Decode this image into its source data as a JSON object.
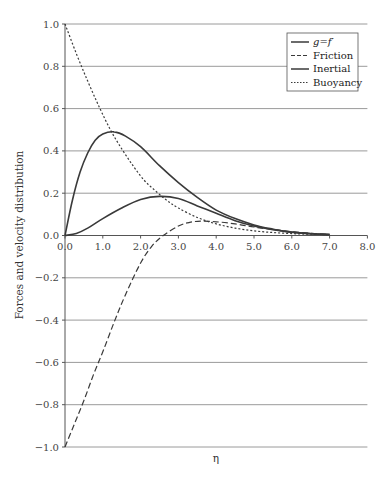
{
  "chart_data": {
    "type": "line",
    "title": "",
    "xlabel": "η",
    "ylabel": "Forces and velocity distribution",
    "xlim": [
      0,
      8
    ],
    "ylim": [
      -1.0,
      1.0
    ],
    "x_ticks": [
      "0.0",
      "1.0",
      "2.0",
      "3.0",
      "4.0",
      "5.0",
      "6.0",
      "7.0",
      "8.0"
    ],
    "y_ticks": [
      "1.0",
      "0.8",
      "0.6",
      "0.4",
      "0.2",
      "0.0",
      "−0.2",
      "−0.4",
      "−0.6",
      "−0.8",
      "−1.0"
    ],
    "grid": "horizontal",
    "legend_position": "top-right",
    "series": [
      {
        "name": "g=f′",
        "style": "solid",
        "x": [
          0,
          0.2,
          0.4,
          0.6,
          0.8,
          1.0,
          1.3,
          1.6,
          2.0,
          2.5,
          3.0,
          3.5,
          4.0,
          4.5,
          5.0,
          5.5,
          6.0,
          6.5,
          7.0
        ],
        "values": [
          0,
          0.17,
          0.3,
          0.39,
          0.45,
          0.48,
          0.49,
          0.47,
          0.42,
          0.33,
          0.25,
          0.18,
          0.12,
          0.08,
          0.05,
          0.03,
          0.015,
          0.008,
          0.004
        ]
      },
      {
        "name": "Friction",
        "style": "dashed",
        "x": [
          0,
          0.25,
          0.5,
          0.75,
          1.0,
          1.3,
          1.6,
          2.0,
          2.3,
          2.6,
          3.0,
          3.3,
          3.6,
          4.0,
          4.5,
          5.0,
          5.5,
          6.0,
          6.5,
          7.0
        ],
        "values": [
          -1.0,
          -0.89,
          -0.78,
          -0.66,
          -0.55,
          -0.41,
          -0.28,
          -0.13,
          -0.05,
          0.0,
          0.045,
          0.062,
          0.068,
          0.065,
          0.055,
          0.04,
          0.028,
          0.018,
          0.01,
          0.005
        ]
      },
      {
        "name": "Inertial",
        "style": "solid",
        "x": [
          0,
          0.3,
          0.6,
          1.0,
          1.5,
          2.0,
          2.5,
          3.0,
          3.5,
          4.0,
          4.5,
          5.0,
          5.5,
          6.0,
          6.5,
          7.0
        ],
        "values": [
          0,
          0.01,
          0.035,
          0.08,
          0.13,
          0.17,
          0.185,
          0.175,
          0.14,
          0.105,
          0.07,
          0.045,
          0.028,
          0.016,
          0.009,
          0.005
        ]
      },
      {
        "name": "Buoyancy",
        "style": "dotted",
        "x": [
          0,
          0.3,
          0.6,
          0.9,
          1.2,
          1.5,
          1.8,
          2.1,
          2.4,
          2.7,
          3.0,
          3.5,
          4.0,
          4.5,
          5.0,
          5.5,
          6.0,
          6.5,
          7.0
        ],
        "values": [
          1.0,
          0.86,
          0.73,
          0.61,
          0.5,
          0.41,
          0.33,
          0.26,
          0.21,
          0.165,
          0.13,
          0.085,
          0.055,
          0.035,
          0.022,
          0.014,
          0.009,
          0.006,
          0.004
        ]
      }
    ],
    "legend": [
      "g=f′",
      "Friction",
      "Inertial",
      "Buoyancy"
    ]
  },
  "colors": {
    "line": "#3a3a3a",
    "grid": "#9a9a9a",
    "axis": "#555555"
  }
}
